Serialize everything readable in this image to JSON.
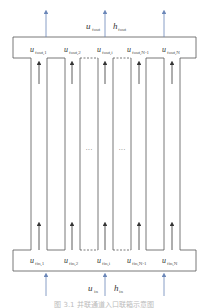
{
  "outlet": {
    "symbol_u": "u",
    "sub_u": "fout",
    "symbol_h": "h",
    "sub_h": "fout"
  },
  "inlet": {
    "symbol_u": "u",
    "sub_u": "in",
    "symbol_h": "h",
    "sub_h": "in"
  },
  "channels_out": [
    {
      "symbol": "u",
      "sub": "fout,1"
    },
    {
      "symbol": "u",
      "sub": "fout,2"
    },
    {
      "symbol": "u",
      "sub": "fout,i"
    },
    {
      "symbol": "u",
      "sub": "fout,N-1"
    },
    {
      "symbol": "u",
      "sub": "fout,N"
    }
  ],
  "channels_in": [
    {
      "symbol": "u",
      "sub": "fin,1"
    },
    {
      "symbol": "u",
      "sub": "fin,2"
    },
    {
      "symbol": "u",
      "sub": "fin,i"
    },
    {
      "symbol": "u",
      "sub": "fin,N-1"
    },
    {
      "symbol": "u",
      "sub": "fin,N"
    }
  ],
  "ellipsis": "···",
  "caption": "图 3.1  并联通道入口联箱示意图",
  "colors": {
    "line": "#555555",
    "arrow_blue": "#6a86b8",
    "arrow_dark": "#333333"
  }
}
